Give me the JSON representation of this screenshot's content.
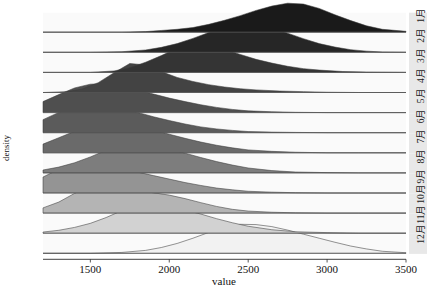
{
  "chart_data": {
    "type": "area",
    "subtype": "ridgeline-joyplot",
    "title": "",
    "xlabel": "value",
    "ylabel": "density",
    "xlim": [
      1200,
      3500
    ],
    "xticks": [
      1500,
      2000,
      2500,
      3000,
      3500
    ],
    "xtick_labels": [
      "1500",
      "2000",
      "2500",
      "3000",
      "3500"
    ],
    "grid": false,
    "legend_position": "none",
    "facet_labels": [
      "1月",
      "2月",
      "3月",
      "4月",
      "5月",
      "6月",
      "7月",
      "8月",
      "9月",
      "10月",
      "11月",
      "12月"
    ],
    "facet_label_position": "right",
    "fill_colors": [
      "#1a1a1a",
      "#262626",
      "#343434",
      "#434343",
      "#4f4f4f",
      "#5b5b5b",
      "#6a6a6a",
      "#7d7d7d",
      "#949494",
      "#b4b4b4",
      "#d2d2d2",
      "#f2f2f2"
    ],
    "series": [
      {
        "name": "1月",
        "peak_value": 2750,
        "x": [
          1200,
          1500,
          1700,
          1850,
          1950,
          2050,
          2150,
          2250,
          2350,
          2450,
          2550,
          2650,
          2750,
          2850,
          2950,
          3050,
          3150,
          3250,
          3350,
          3500
        ],
        "values": [
          0.0,
          0.0,
          0.0,
          0.02,
          0.06,
          0.1,
          0.16,
          0.27,
          0.41,
          0.57,
          0.75,
          0.9,
          1.0,
          0.97,
          0.82,
          0.6,
          0.4,
          0.22,
          0.1,
          0.03
        ]
      },
      {
        "name": "2月",
        "peak_value": 2450,
        "x": [
          1200,
          1500,
          1700,
          1850,
          1950,
          2050,
          2150,
          2250,
          2350,
          2450,
          2550,
          2650,
          2750,
          2850,
          2950,
          3050,
          3150,
          3250,
          3350,
          3500
        ],
        "values": [
          0.0,
          0.0,
          0.02,
          0.08,
          0.17,
          0.3,
          0.48,
          0.68,
          0.87,
          1.0,
          0.98,
          0.85,
          0.66,
          0.47,
          0.3,
          0.18,
          0.09,
          0.04,
          0.01,
          0.0
        ]
      },
      {
        "name": "3月",
        "peak_value": 2150,
        "x": [
          1200,
          1500,
          1650,
          1750,
          1850,
          1950,
          2050,
          2150,
          2250,
          2350,
          2450,
          2550,
          2650,
          2750,
          2850,
          2950,
          3100,
          3250,
          3500
        ],
        "values": [
          0.0,
          0.0,
          0.05,
          0.16,
          0.35,
          0.58,
          0.83,
          1.0,
          0.96,
          0.8,
          0.62,
          0.45,
          0.32,
          0.21,
          0.13,
          0.08,
          0.03,
          0.01,
          0.0
        ]
      },
      {
        "name": "4月",
        "peak_value": 1780,
        "x": [
          1200,
          1350,
          1450,
          1550,
          1650,
          1750,
          1850,
          1950,
          2050,
          2150,
          2250,
          2350,
          2450,
          2550,
          2700,
          2850,
          3000,
          3200,
          3500
        ],
        "values": [
          0.0,
          0.03,
          0.12,
          0.34,
          0.68,
          1.0,
          0.95,
          0.72,
          0.52,
          0.38,
          0.27,
          0.19,
          0.13,
          0.09,
          0.05,
          0.03,
          0.01,
          0.0,
          0.0
        ]
      },
      {
        "name": "5月",
        "peak_value": 1600,
        "x": [
          1200,
          1300,
          1400,
          1500,
          1600,
          1700,
          1800,
          1900,
          2000,
          2100,
          2200,
          2300,
          2400,
          2500,
          2650,
          2800,
          3000,
          3200,
          3500
        ],
        "values": [
          0.38,
          0.62,
          0.85,
          0.98,
          1.0,
          0.92,
          0.78,
          0.64,
          0.5,
          0.38,
          0.27,
          0.18,
          0.11,
          0.06,
          0.03,
          0.01,
          0.0,
          0.0,
          0.0
        ]
      },
      {
        "name": "6月",
        "peak_value": 1580,
        "x": [
          1200,
          1300,
          1400,
          1500,
          1600,
          1700,
          1800,
          1900,
          2000,
          2100,
          2200,
          2300,
          2400,
          2500,
          2650,
          2800,
          3000,
          3200,
          3500
        ],
        "values": [
          0.45,
          0.7,
          0.9,
          1.0,
          0.97,
          0.85,
          0.7,
          0.55,
          0.42,
          0.3,
          0.2,
          0.13,
          0.08,
          0.04,
          0.02,
          0.01,
          0.0,
          0.0,
          0.0
        ]
      },
      {
        "name": "7月",
        "peak_value": 1680,
        "x": [
          1200,
          1300,
          1400,
          1500,
          1600,
          1700,
          1800,
          1900,
          2000,
          2100,
          2200,
          2300,
          2400,
          2500,
          2650,
          2800,
          3000,
          3200,
          3500
        ],
        "values": [
          0.3,
          0.52,
          0.74,
          0.9,
          0.98,
          1.0,
          0.92,
          0.79,
          0.64,
          0.5,
          0.37,
          0.26,
          0.17,
          0.1,
          0.05,
          0.02,
          0.0,
          0.0,
          0.0
        ]
      },
      {
        "name": "8月",
        "peak_value": 1800,
        "x": [
          1200,
          1300,
          1400,
          1500,
          1600,
          1700,
          1800,
          1900,
          2000,
          2100,
          2200,
          2300,
          2400,
          2500,
          2650,
          2800,
          3000,
          3200,
          3500
        ],
        "values": [
          0.1,
          0.2,
          0.35,
          0.55,
          0.78,
          0.94,
          1.0,
          0.95,
          0.83,
          0.68,
          0.53,
          0.39,
          0.27,
          0.17,
          0.08,
          0.03,
          0.01,
          0.0,
          0.0
        ]
      },
      {
        "name": "9月",
        "peak_value": 1520,
        "x": [
          1200,
          1300,
          1400,
          1500,
          1600,
          1700,
          1800,
          1900,
          2000,
          2100,
          2200,
          2300,
          2400,
          2500,
          2650,
          2800,
          3000,
          3200,
          3500
        ],
        "values": [
          0.55,
          0.82,
          0.96,
          1.0,
          0.94,
          0.84,
          0.72,
          0.6,
          0.48,
          0.36,
          0.26,
          0.17,
          0.11,
          0.06,
          0.03,
          0.01,
          0.0,
          0.0,
          0.0
        ]
      },
      {
        "name": "10月",
        "peak_value": 1620,
        "x": [
          1200,
          1300,
          1400,
          1500,
          1600,
          1700,
          1800,
          1900,
          2000,
          2100,
          2200,
          2300,
          2400,
          2500,
          2650,
          2800,
          3000,
          3200,
          3500
        ],
        "values": [
          0.18,
          0.38,
          0.68,
          0.92,
          1.0,
          0.9,
          0.78,
          0.7,
          0.62,
          0.5,
          0.36,
          0.23,
          0.13,
          0.07,
          0.03,
          0.01,
          0.0,
          0.0,
          0.0
        ]
      },
      {
        "name": "11月",
        "peak_value": 1830,
        "x": [
          1200,
          1300,
          1400,
          1500,
          1600,
          1700,
          1800,
          1900,
          2000,
          2100,
          2200,
          2300,
          2400,
          2500,
          2650,
          2800,
          3000,
          3200,
          3500
        ],
        "values": [
          0.04,
          0.1,
          0.2,
          0.34,
          0.54,
          0.78,
          0.95,
          1.0,
          0.92,
          0.8,
          0.66,
          0.5,
          0.36,
          0.24,
          0.12,
          0.05,
          0.02,
          0.0,
          0.0
        ]
      },
      {
        "name": "12月",
        "peak_value": 2480,
        "x": [
          1200,
          1500,
          1700,
          1850,
          1950,
          2050,
          2150,
          2250,
          2350,
          2450,
          2550,
          2650,
          2750,
          2850,
          2950,
          3050,
          3150,
          3250,
          3350,
          3500
        ],
        "values": [
          0.0,
          0.0,
          0.03,
          0.1,
          0.2,
          0.34,
          0.52,
          0.72,
          0.9,
          1.0,
          0.99,
          0.92,
          0.8,
          0.66,
          0.52,
          0.38,
          0.25,
          0.15,
          0.07,
          0.02
        ]
      }
    ]
  },
  "axes": {
    "x_title": "value",
    "y_title": "density"
  }
}
